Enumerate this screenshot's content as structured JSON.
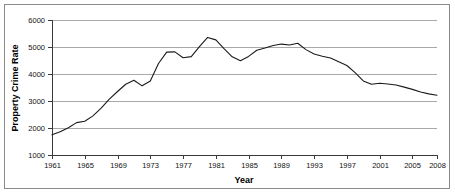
{
  "chart_data": {
    "type": "line",
    "title": "",
    "xlabel": "Year",
    "ylabel": "Property Crime Rate",
    "xlim": [
      1961,
      2008
    ],
    "ylim": [
      1000,
      6000
    ],
    "grid": true,
    "legend": "none",
    "y_ticks": [
      1000,
      2000,
      3000,
      4000,
      5000,
      6000
    ],
    "y_tick_labels": [
      "1000",
      "2000",
      "3000",
      "4000",
      "5000",
      "6000"
    ],
    "x_ticks": [
      1961,
      1965,
      1969,
      1973,
      1977,
      1981,
      1985,
      1989,
      1993,
      1997,
      2001,
      2005,
      2008
    ],
    "x_tick_labels": [
      "1961",
      "1965",
      "1969",
      "1973",
      "1977",
      "1981",
      "1985",
      "1989",
      "1993",
      "1997",
      "2001",
      "2005",
      "2008"
    ],
    "series": [
      {
        "name": "Property Crime Rate",
        "color": "#1a1a1a",
        "x": [
          1961,
          1962,
          1963,
          1964,
          1965,
          1966,
          1967,
          1968,
          1969,
          1970,
          1971,
          1972,
          1973,
          1974,
          1975,
          1976,
          1977,
          1978,
          1979,
          1980,
          1981,
          1982,
          1983,
          1984,
          1985,
          1986,
          1987,
          1988,
          1989,
          1990,
          1991,
          1992,
          1993,
          1994,
          1995,
          1996,
          1997,
          1998,
          1999,
          2000,
          2001,
          2002,
          2003,
          2004,
          2005,
          2006,
          2007,
          2008
        ],
        "values": [
          1747,
          1858,
          2012,
          2198,
          2249,
          2450,
          2736,
          3071,
          3351,
          3621,
          3769,
          3561,
          3737,
          4389,
          4811,
          4820,
          4602,
          4643,
          5017,
          5353,
          5264,
          4941,
          4637,
          4492,
          4651,
          4881,
          4963,
          5054,
          5108,
          5073,
          5140,
          4903,
          4740,
          4660,
          4591,
          4451,
          4316,
          4053,
          3743,
          3618,
          3658,
          3631,
          3591,
          3514,
          3431,
          3335,
          3264,
          3212
        ]
      }
    ]
  }
}
